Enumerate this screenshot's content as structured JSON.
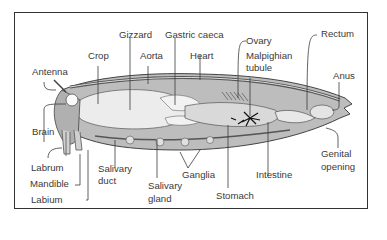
{
  "figure": {
    "labels": {
      "gizzard": "Gizzard",
      "gastric_caeca": "Gastric caeca",
      "crop": "Crop",
      "aorta": "Aorta",
      "heart": "Heart",
      "ovary": "Ovary",
      "malpighian_tubule_1": "Malpighian",
      "malpighian_tubule_2": "tubule",
      "rectum": "Rectum",
      "antenna": "Antenna",
      "anus": "Anus",
      "brain": "Brain",
      "labrum": "Labrum",
      "mandible": "Mandible",
      "labium": "Labium",
      "salivary_duct_1": "Salivary",
      "salivary_duct_2": "duct",
      "salivary_gland_1": "Salivary",
      "salivary_gland_2": "gland",
      "ganglia": "Ganglia",
      "stomach": "Stomach",
      "intestine": "Intestine",
      "genital_opening_1": "Genital",
      "genital_opening_2": "opening"
    },
    "colors": {
      "ink": "#3a3a3a",
      "body_fill": "#bdbdbd",
      "organ_light": "#e6e6e6",
      "organ_mid": "#9a9a9a",
      "frame": "#333333"
    }
  }
}
